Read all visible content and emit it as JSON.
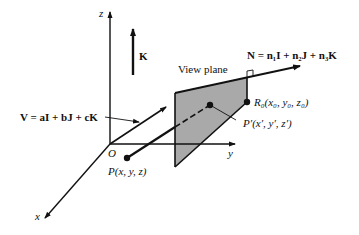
{
  "diagram": {
    "type": "3D view plane geometry",
    "axes": {
      "z_label": "z",
      "y_label": "y",
      "x_label": "x",
      "origin_label": "O"
    },
    "vectors": {
      "K_label": "K",
      "V_label": "V = aI + bJ + cK",
      "N_label": "N = n₁I + n₂J + n₃K"
    },
    "plane": {
      "label": "View plane",
      "fill_color": "#a9a9a9"
    },
    "points": {
      "R0_label": "R₀(x₀, y₀, z₀)",
      "P_label": "P(x, y, z)",
      "Pprime_label": "P′(x′, y′, z′)"
    },
    "colors": {
      "ink": "#111111",
      "background": "#ffffff"
    }
  }
}
